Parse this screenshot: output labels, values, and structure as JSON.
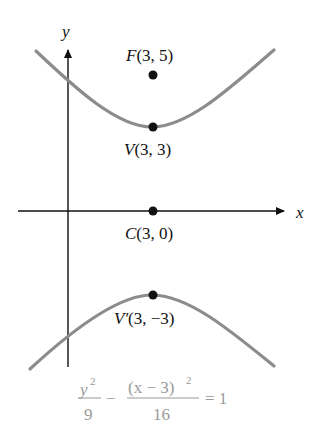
{
  "figure": {
    "axes": {
      "x_label": "x",
      "y_label": "y"
    },
    "points": [
      {
        "id": "F",
        "name": "F",
        "coords": "(3, 5)",
        "x": 3,
        "y": 5
      },
      {
        "id": "V",
        "name": "V",
        "coords": "(3, 3)",
        "x": 3,
        "y": 3
      },
      {
        "id": "C",
        "name": "C",
        "coords": "(3, 0)",
        "x": 3,
        "y": 0
      },
      {
        "id": "Vp",
        "name": "V′",
        "coords": "(3, −3)",
        "x": 3,
        "y": -3
      }
    ],
    "equation": {
      "term1_num": "y",
      "term1_num_exp": "2",
      "term1_den": "9",
      "minus": "−",
      "term2_num": "(x − 3)",
      "term2_num_exp": "2",
      "term2_den": "16",
      "rhs": "= 1"
    },
    "colors": {
      "curve": "#8c8c8c",
      "axis": "#111111",
      "point": "#111111",
      "equation": "#9a9a9a"
    }
  }
}
